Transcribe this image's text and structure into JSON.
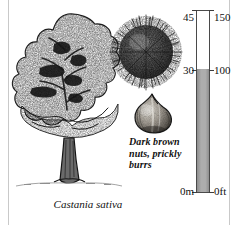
{
  "plate": {
    "kind": "botanical-field-guide-plate",
    "species_caption": "Castania sativa",
    "feature_caption_lines": [
      "Dark brown",
      "nuts, prickly",
      "burrs"
    ],
    "illustrations": [
      {
        "name": "tree-habit",
        "label": "spreading deciduous tree with broad domed crown and stout flared trunk"
      },
      {
        "name": "burr",
        "label": "round spiny husk"
      },
      {
        "name": "nut",
        "label": "glossy teardrop-shaped chestnut"
      }
    ]
  },
  "scale": {
    "metres_unit": "m",
    "feet_unit": "ft",
    "top": {
      "metres": "45",
      "feet": "150"
    },
    "mid": {
      "metres": "30",
      "feet": "100"
    },
    "bottom": {
      "metres": "0m",
      "feet": "0ft"
    },
    "fill_fraction_percent": 67,
    "colors": {
      "fill": "#adadad",
      "outline": "#4a4a4a",
      "empty": "#ffffff"
    }
  },
  "colors": {
    "ink": "#111111",
    "frame_rule": "#c9c9c9",
    "paper": "#ffffff"
  }
}
